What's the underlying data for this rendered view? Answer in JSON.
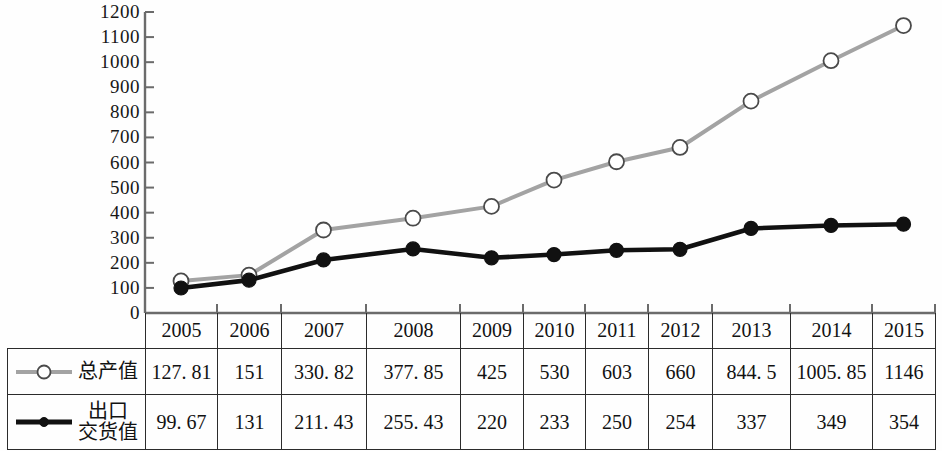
{
  "chart_data": {
    "type": "line",
    "title": "",
    "xlabel": "",
    "ylabel": "",
    "ylim": [
      0,
      1200
    ],
    "ytick_step": 100,
    "grid": false,
    "legend_position": "table-left",
    "categories": [
      "2005",
      "2006",
      "2007",
      "2008",
      "2009",
      "2010",
      "2011",
      "2012",
      "2013",
      "2014",
      "2015"
    ],
    "series": [
      {
        "name": "总产值",
        "color": "#a3a3a3",
        "marker": "open-circle",
        "values": [
          127.81,
          151,
          330.82,
          377.85,
          425,
          530,
          603,
          660,
          844.5,
          1005.85,
          1146
        ],
        "display_values": [
          "127. 81",
          "151",
          "330. 82",
          "377. 85",
          "425",
          "530",
          "603",
          "660",
          "844. 5",
          "1005. 85",
          "1146"
        ]
      },
      {
        "name": "出口\n交货值",
        "color": "#111111",
        "marker": "filled-circle",
        "values": [
          99.67,
          131,
          211.43,
          255.43,
          220,
          233,
          250,
          254,
          337,
          349,
          354
        ],
        "display_values": [
          "99. 67",
          "131",
          "211. 43",
          "255. 43",
          "220",
          "233",
          "250",
          "254",
          "337",
          "349",
          "354"
        ]
      }
    ],
    "ytick_labels": [
      "1200",
      "1100",
      "1000",
      "900",
      "800",
      "700",
      "600",
      "500",
      "400",
      "300",
      "200",
      "100",
      "0"
    ]
  },
  "table": {
    "header": [
      "2005",
      "2006",
      "2007",
      "2008",
      "2009",
      "2010",
      "2011",
      "2012",
      "2013",
      "2014",
      "2015"
    ],
    "rows": [
      {
        "label": "总产值",
        "marker": "open-circle",
        "cells": [
          "127. 81",
          "151",
          "330. 82",
          "377. 85",
          "425",
          "530",
          "603",
          "660",
          "844. 5",
          "1005. 85",
          "1146"
        ]
      },
      {
        "label": "出口\n交货值",
        "marker": "filled-circle",
        "cells": [
          "99. 67",
          "131",
          "211. 43",
          "255. 43",
          "220",
          "233",
          "250",
          "254",
          "337",
          "349",
          "354"
        ]
      }
    ]
  },
  "colors": {
    "series_total": "#a3a3a3",
    "series_export": "#111111",
    "axis": "#6b6b6b",
    "grid_line": "#2b2b2b",
    "background": "#fefefe"
  }
}
